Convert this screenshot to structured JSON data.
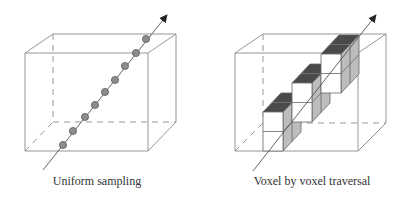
{
  "colors": {
    "edge": "#8a8a8a",
    "ray": "#555555",
    "dot_fill": "#8c8c8c",
    "dot_stroke": "#555555",
    "voxel_front": "#ffffff",
    "voxel_top": "#4a4a4a",
    "voxel_side": "#bdbdbd",
    "voxel_edge": "#666666",
    "arrowhead": "#222222"
  },
  "panels": [
    {
      "id": "uniform",
      "caption": "Uniform sampling",
      "caption_pos": [
        97,
        185
      ],
      "box": {
        "front": [
          [
            25,
            53
          ],
          [
            148,
            53
          ],
          [
            148,
            151
          ],
          [
            25,
            151
          ]
        ],
        "back": [
          [
            53,
            34
          ],
          [
            176,
            34
          ],
          [
            176,
            122
          ],
          [
            53,
            122
          ]
        ]
      },
      "ray": {
        "start": [
          43,
          170
        ],
        "tip": [
          167,
          15
        ]
      },
      "samples": [
        [
          63,
          145
        ],
        [
          73,
          131
        ],
        [
          85,
          117
        ],
        [
          95,
          105
        ],
        [
          105,
          92
        ],
        [
          115,
          80
        ],
        [
          125,
          66
        ],
        [
          136,
          53
        ],
        [
          146,
          39
        ]
      ],
      "sample_radius": 3.6
    },
    {
      "id": "voxel",
      "caption": "Voxel by voxel traversal",
      "caption_pos": [
        312,
        185
      ],
      "box": {
        "front": [
          [
            235,
            53
          ],
          [
            358,
            53
          ],
          [
            358,
            151
          ],
          [
            235,
            151
          ]
        ],
        "back": [
          [
            263,
            34
          ],
          [
            386,
            34
          ],
          [
            386,
            123
          ],
          [
            263,
            123
          ]
        ]
      },
      "ray": {
        "start": [
          253,
          171
        ],
        "tip": [
          376,
          15
        ]
      },
      "voxel_size": {
        "w": 20,
        "h": 19.5,
        "dx": 9,
        "dy": -9.5
      },
      "stacks": [
        {
          "x": 263,
          "bottom": 151,
          "rows": 2,
          "deep": 2
        },
        {
          "x": 292,
          "bottom": 122,
          "rows": 2,
          "deep": 2
        },
        {
          "x": 321,
          "bottom": 93,
          "rows": 2,
          "deep": 2
        }
      ]
    }
  ]
}
